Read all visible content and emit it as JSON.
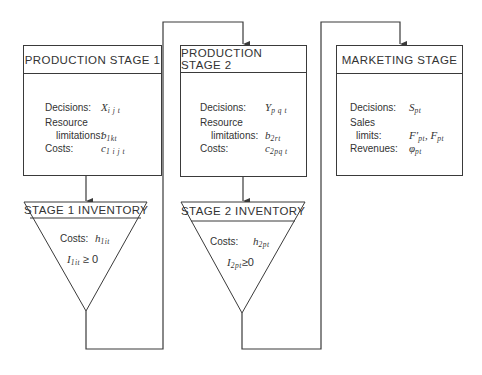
{
  "diagram": {
    "type": "flowchart",
    "stages": [
      {
        "id": "production-stage-1",
        "title": "PRODUCTION STAGE 1",
        "rows": [
          {
            "label": "Decisions:",
            "symbol": "X",
            "sub": "i j t"
          },
          {
            "label": "Resource",
            "symbol": "",
            "sub": ""
          },
          {
            "label": "limitations:",
            "symbol": "b",
            "sub": "1kt"
          },
          {
            "label": "Costs:",
            "symbol": "c",
            "sub": "1 i j t"
          }
        ]
      },
      {
        "id": "production-stage-2",
        "title": "PRODUCTION STAGE 2",
        "rows": [
          {
            "label": "Decisions:",
            "symbol": "Y",
            "sub": "p q t"
          },
          {
            "label": "Resource",
            "symbol": "",
            "sub": ""
          },
          {
            "label": "limitations:",
            "symbol": "b",
            "sub": "2rt"
          },
          {
            "label": "Costs:",
            "symbol": "c",
            "sub": "2pq t"
          }
        ]
      },
      {
        "id": "marketing-stage",
        "title": "MARKETING STAGE",
        "rows": [
          {
            "label": "Decisions:",
            "symbol": "S",
            "sub": "pt"
          },
          {
            "label": "Sales",
            "symbol": "",
            "sub": ""
          },
          {
            "label": "limits:",
            "symbol": "F′",
            "sub": "pt",
            "symbol2": ", F",
            "sub2": "pt"
          },
          {
            "label": "Revenues:",
            "symbol": "φ",
            "sub": "pt"
          }
        ]
      }
    ],
    "inventories": [
      {
        "id": "stage-1-inventory",
        "title": "STAGE 1 INVENTORY",
        "costs_label": "Costs:",
        "costs_symbol": "h",
        "costs_sub": "1it",
        "constraint_symbol": "I",
        "constraint_sub": "1it",
        "constraint_rel": "≥ 0"
      },
      {
        "id": "stage-2-inventory",
        "title": "STAGE 2 INVENTORY",
        "costs_label": "Costs:",
        "costs_symbol": "h",
        "costs_sub": "2pt",
        "constraint_symbol": "I",
        "constraint_sub": "2pt",
        "constraint_rel": "≥0"
      }
    ],
    "flow": [
      "PRODUCTION STAGE 1",
      "STAGE 1 INVENTORY",
      "PRODUCTION STAGE 2",
      "STAGE 2 INVENTORY",
      "MARKETING STAGE"
    ],
    "colors": {
      "line": "#3a3a3a",
      "text": "#333333",
      "background": "#ffffff"
    }
  }
}
